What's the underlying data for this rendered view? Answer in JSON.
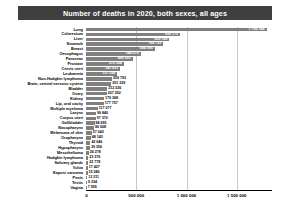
{
  "chart_data": {
    "type": "bar",
    "orientation": "horizontal",
    "title": "Number of deaths in 2020, both sexes, all ages",
    "xlabel": "",
    "ylabel": "",
    "xlim": [
      0,
      1850000
    ],
    "grid": true,
    "legend": false,
    "xticks": [
      "0",
      "500 000",
      "1 000 000",
      "1 500 000"
    ],
    "xtick_values": [
      0,
      500000,
      1000000,
      1500000
    ],
    "categories": [
      "Lung",
      "Colorectum",
      "Liver",
      "Stomach",
      "Breast",
      "Oesophagus",
      "Pancreas",
      "Prostate",
      "Cervix uteri",
      "Leukaemia",
      "Non-Hodgkin lymphoma",
      "Brain, central nervous system",
      "Bladder",
      "Ovary",
      "Kidney",
      "Lip, oral cavity",
      "Multiple myeloma",
      "Larynx",
      "Corpus uteri",
      "Gallbladder",
      "Nasopharynx",
      "Melanoma of skin",
      "Oropharynx",
      "Thyroid",
      "Hypopharynx",
      "Mesothelioma",
      "Hodgkin lymphoma",
      "Salivary glands",
      "Vulva",
      "Kaposi sarcoma",
      "Penis",
      "Testis",
      "Vagina"
    ],
    "values": [
      1796144,
      935173,
      830180,
      768793,
      684996,
      544076,
      466003,
      375304,
      341831,
      311594,
      259793,
      251329,
      212536,
      207252,
      179368,
      177757,
      117077,
      99840,
      97370,
      84695,
      80008,
      57043,
      48143,
      43646,
      39356,
      26278,
      23376,
      22778,
      17427,
      15086,
      13211,
      9334,
      7995
    ],
    "value_labels": [
      "1 796 144",
      "935 173",
      "830 180",
      "768 793",
      "684 996",
      "544 076",
      "466 003",
      "375 304",
      "341 831",
      "311 594",
      "259 793",
      "251 329",
      "212 536",
      "207 252",
      "179 368",
      "177 757",
      "117 077",
      "99 840",
      "97 370",
      "84 695",
      "80 008",
      "57 043",
      "48 143",
      "43 646",
      "39 356",
      "26 278",
      "23 376",
      "22 778",
      "17 427",
      "15 086",
      "13 211",
      "9 334",
      "7 995"
    ],
    "bar_color": "#808080",
    "title_bar_color": "#3f3f3f",
    "title_text_color": "#ffffff",
    "grid_color": "#c8c8c8",
    "axis_color": "#000000"
  }
}
